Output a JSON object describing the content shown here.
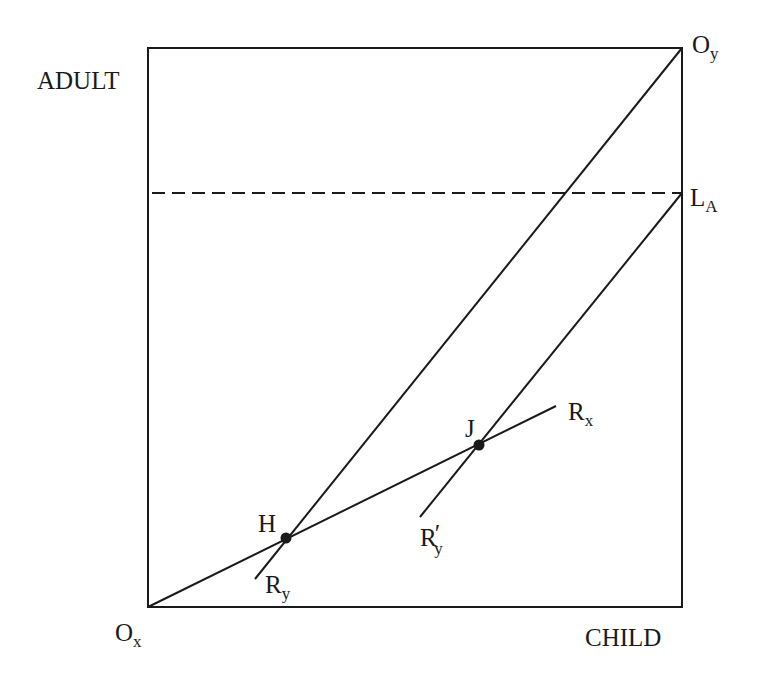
{
  "diagram": {
    "type": "edgeworth-box",
    "colors": {
      "line": "#1a1a1a",
      "background": "#ffffff"
    },
    "box": {
      "x1": 148,
      "y1": 48,
      "x2": 682,
      "y2": 607
    },
    "axes": {
      "vertical_label": "ADULT",
      "horizontal_label": "CHILD"
    },
    "origins": {
      "ox": {
        "main": "O",
        "sub": "x"
      },
      "oy": {
        "main": "O",
        "sub": "y"
      }
    },
    "dashed_line": {
      "label_main": "L",
      "label_sub": "A",
      "y": 193
    },
    "curves": {
      "rx": {
        "main": "R",
        "sub": "x"
      },
      "ry": {
        "main": "R",
        "sub": "y"
      },
      "ry_prime": {
        "main": "R",
        "prime": "′",
        "sub": "y"
      }
    },
    "points": {
      "h": {
        "label": "H",
        "x": 286,
        "y": 538
      },
      "j": {
        "label": "J",
        "x": 479,
        "y": 445
      }
    }
  }
}
